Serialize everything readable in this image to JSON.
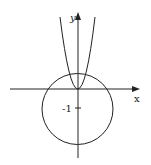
{
  "diagram": {
    "axes": {
      "x_label": "x",
      "y_label": "y"
    },
    "tick_labels": [
      {
        "text": "-1",
        "axis": "y",
        "value": -1
      }
    ],
    "curves": [
      {
        "type": "parabola",
        "vertex": [
          0,
          0
        ],
        "opens": "up"
      },
      {
        "type": "circle",
        "center": [
          0,
          -1
        ],
        "radius_approx": 1.5
      }
    ],
    "colors": {
      "ink": "#222222",
      "background": "#ffffff"
    }
  }
}
